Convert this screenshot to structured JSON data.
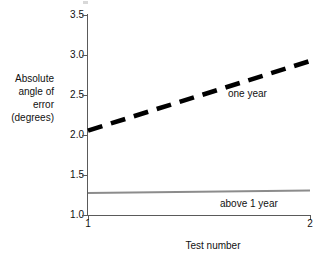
{
  "chart_data": {
    "type": "line",
    "title": "",
    "xlabel": "Test number",
    "ylabel": "Absolute\nangle of\nerror\n(degrees)",
    "xlim": [
      1,
      2
    ],
    "ylim": [
      1.0,
      3.5
    ],
    "xticks": [
      "1",
      "2"
    ],
    "yticks": [
      "3.5",
      "3.0",
      "2.5",
      "2.0",
      "1.5",
      "1.0"
    ],
    "grid": false,
    "legend_position": "inline-annotation",
    "x": [
      1,
      2
    ],
    "series": [
      {
        "name": "one year",
        "label": "one year",
        "values": [
          2.05,
          2.92
        ],
        "style": "dashed",
        "color": "#000000",
        "width": 4.6
      },
      {
        "name": "above 1 year",
        "label": "above 1 year",
        "values": [
          1.27,
          1.3
        ],
        "style": "solid",
        "color": "#8c8c8c",
        "width": 2.0
      }
    ]
  },
  "axes": {
    "color": "#5a5a5a"
  }
}
